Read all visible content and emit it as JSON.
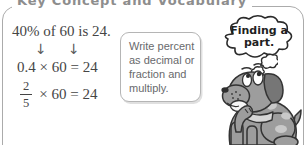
{
  "title": "Key Concept and Vocabulary",
  "equations": {
    "statement": "40% of 60 is 24.",
    "arrow": "↓",
    "decimal_equation": "0.4 × 60 = 24",
    "fraction": {
      "numerator": "2",
      "denominator": "5",
      "rest": "× 60 = 24"
    }
  },
  "callout": {
    "lines": [
      "Write percent",
      "as decimal or",
      "fraction and",
      "multiply."
    ]
  },
  "thought": {
    "line1": "Finding a",
    "line2": "part."
  },
  "colors": {
    "frame_border": "#ababab",
    "title_gray": "#8d8d8d",
    "equation_text": "#454545",
    "callout_text": "#68696c",
    "callout_border": "#b5b5b5",
    "cloud_outline": "#2b2b2b",
    "dog_body": "#9d9d9d",
    "dog_outline": "#333333",
    "dog_spots": "#c9c9c9"
  }
}
